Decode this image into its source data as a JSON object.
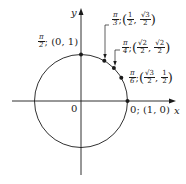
{
  "diagram": {
    "type": "unit-circle",
    "axes": {
      "x_label": "x",
      "y_label": "y",
      "origin_label": "0"
    },
    "colors": {
      "stroke": "#1a1a1a",
      "background": "#ffffff"
    },
    "points": [
      {
        "angle_num": "π",
        "angle_den": "2",
        "coord_text": "(0, 1)",
        "x": "0",
        "y": "1"
      },
      {
        "angle_num": "π",
        "angle_den": "3",
        "x_num": "1",
        "x_den": "2",
        "y_num": "√3",
        "y_den": "2"
      },
      {
        "angle_num": "π",
        "angle_den": "4",
        "x_num": "√2",
        "x_den": "2",
        "y_num": "√2",
        "y_den": "2"
      },
      {
        "angle_num": "π",
        "angle_den": "6",
        "x_num": "√3",
        "x_den": "2",
        "y_num": "1",
        "y_den": "2"
      },
      {
        "angle_text": "0",
        "coord_text": "(1, 0)"
      }
    ]
  }
}
